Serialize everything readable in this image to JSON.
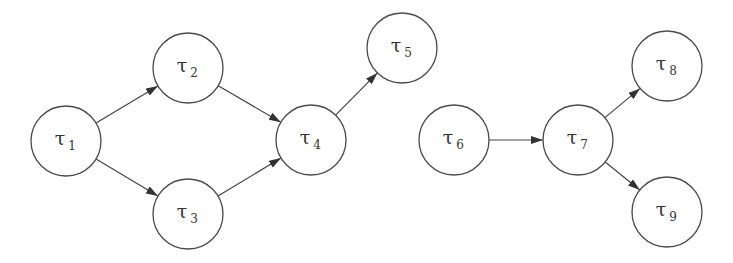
{
  "diagram": {
    "type": "directed task graph",
    "node_radius": 35,
    "colors": {
      "stroke": "#4a4a4a",
      "text": "#333333",
      "background": "#ffffff"
    },
    "nodes": [
      {
        "id": "t1",
        "symbol": "τ",
        "index": "1",
        "cx": 66,
        "cy": 141
      },
      {
        "id": "t2",
        "symbol": "τ",
        "index": "2",
        "cx": 188,
        "cy": 68
      },
      {
        "id": "t3",
        "symbol": "τ",
        "index": "3",
        "cx": 188,
        "cy": 214
      },
      {
        "id": "t4",
        "symbol": "τ",
        "index": "4",
        "cx": 311,
        "cy": 140
      },
      {
        "id": "t5",
        "symbol": "τ",
        "index": "5",
        "cx": 402,
        "cy": 48
      },
      {
        "id": "t6",
        "symbol": "τ",
        "index": "6",
        "cx": 454,
        "cy": 140
      },
      {
        "id": "t7",
        "symbol": "τ",
        "index": "7",
        "cx": 578,
        "cy": 140
      },
      {
        "id": "t8",
        "symbol": "τ",
        "index": "8",
        "cx": 667,
        "cy": 66
      },
      {
        "id": "t9",
        "symbol": "τ",
        "index": "9",
        "cx": 667,
        "cy": 212
      }
    ],
    "edges": [
      {
        "from": "t1",
        "to": "t2"
      },
      {
        "from": "t1",
        "to": "t3"
      },
      {
        "from": "t2",
        "to": "t4"
      },
      {
        "from": "t3",
        "to": "t4"
      },
      {
        "from": "t4",
        "to": "t5"
      },
      {
        "from": "t6",
        "to": "t7"
      },
      {
        "from": "t7",
        "to": "t8"
      },
      {
        "from": "t7",
        "to": "t9"
      }
    ]
  }
}
